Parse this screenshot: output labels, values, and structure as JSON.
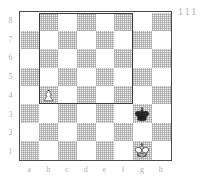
{
  "diagram": {
    "number_label": "111",
    "type": "chess-board-diagram",
    "board_size": 8,
    "orientation": "white-bottom",
    "colors": {
      "light_square": "#ffffff",
      "dark_square": "#e3e3e3",
      "border": "#4a4a4a",
      "overlay_stroke": "#3b3b3b",
      "coordinate_text": "#b0b0b0",
      "piece_outline": "#1a1a1a",
      "white_piece_fill": "#ffffff",
      "black_piece_fill": "#2a2a2a"
    }
  },
  "coordinates": {
    "ranks": [
      "8",
      "7",
      "6",
      "5",
      "4",
      "3",
      "2",
      "1"
    ],
    "files": [
      "a",
      "b",
      "c",
      "d",
      "e",
      "f",
      "g",
      "h"
    ]
  },
  "position": {
    "pieces": [
      {
        "square": "b4",
        "file": "b",
        "rank": "4",
        "piece": "pawn",
        "color": "white",
        "symbol": "♙",
        "name": "white-pawn-b4"
      },
      {
        "square": "g3",
        "file": "g",
        "rank": "3",
        "piece": "king",
        "color": "black",
        "symbol": "♚",
        "name": "black-king-g3"
      },
      {
        "square": "g1",
        "file": "g",
        "rank": "1",
        "piece": "king",
        "color": "white",
        "symbol": "♔",
        "name": "white-king-g1"
      }
    ]
  },
  "overlay": {
    "shape": "rectangle",
    "description": "outlined region",
    "from_file": "b",
    "to_file": "f",
    "from_rank": "8",
    "to_rank": "4"
  }
}
